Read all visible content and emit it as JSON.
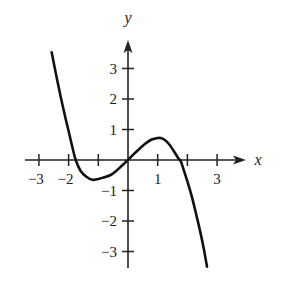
{
  "chart_data": {
    "type": "line",
    "title": "",
    "xlabel": "x",
    "ylabel": "y",
    "xlim": [
      -3.0,
      3.9
    ],
    "ylim": [
      -3.6,
      3.7
    ],
    "grid": false,
    "legend": null,
    "x_ticks": [
      -3,
      -2,
      -1,
      1,
      2,
      3
    ],
    "x_tick_labels": [
      "-3",
      "-2",
      "",
      "1",
      "",
      "3"
    ],
    "y_ticks": [
      -3,
      -2,
      -1,
      1,
      2,
      3
    ],
    "y_tick_labels": [
      "-3",
      "-2",
      "-1",
      "1",
      "2",
      "3"
    ],
    "series": [
      {
        "name": "f(x)",
        "x": [
          -2.57,
          -2.4,
          -2.25,
          -2.1,
          -2.0,
          -1.88,
          -1.76,
          -1.6,
          -1.4,
          -1.2,
          -1.0,
          -0.85,
          -0.6,
          -0.4,
          -0.2,
          0.0,
          0.2,
          0.4,
          0.6,
          0.8,
          1.0,
          1.1,
          1.25,
          1.4,
          1.55,
          1.7,
          1.78,
          1.9,
          2.0,
          2.15,
          2.3,
          2.42,
          2.55,
          2.66
        ],
        "y": [
          3.53,
          2.7,
          2.0,
          1.35,
          0.95,
          0.45,
          0.0,
          -0.35,
          -0.55,
          -0.65,
          -0.62,
          -0.58,
          -0.5,
          -0.36,
          -0.18,
          0.0,
          0.2,
          0.38,
          0.55,
          0.67,
          0.72,
          0.72,
          0.65,
          0.5,
          0.28,
          0.05,
          -0.05,
          -0.4,
          -0.7,
          -1.2,
          -1.8,
          -2.3,
          -2.9,
          -3.5
        ],
        "color": "#111111"
      }
    ],
    "annotations": [],
    "features": {
      "x_intercepts": [
        -1.76,
        0,
        1.78
      ],
      "local_min": [
        -0.9,
        -0.62
      ],
      "local_max": [
        1.05,
        0.72
      ]
    }
  },
  "layout": {
    "origin_px": [
      128,
      160
    ],
    "unit_x_px": 29.7,
    "unit_y_px": 30.5,
    "x_axis_start_px": 25,
    "x_axis_end_px": 246,
    "y_axis_top_px": 40,
    "y_axis_bottom_px": 268,
    "x_label_pos": [
      258,
      165
    ],
    "y_label_pos": [
      128,
      23
    ]
  }
}
